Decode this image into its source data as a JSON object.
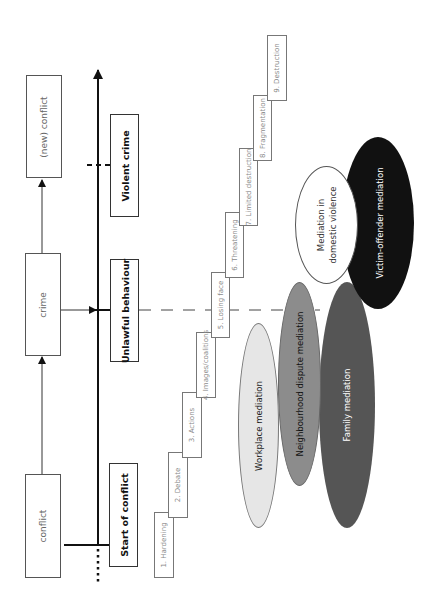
{
  "flow": {
    "nodes": [
      {
        "id": "conflict",
        "label": "conflict"
      },
      {
        "id": "crime",
        "label": "crime"
      },
      {
        "id": "new_conflict",
        "label": "(new) conflict"
      }
    ]
  },
  "stages": [
    {
      "id": "start",
      "label": "Start of conflict"
    },
    {
      "id": "unlawful",
      "label": "Unlawful behaviour"
    },
    {
      "id": "violent",
      "label": "Violent crime"
    }
  ],
  "escalation_steps": [
    {
      "n": 1,
      "label": "1. Hardening"
    },
    {
      "n": 2,
      "label": "2. Debate"
    },
    {
      "n": 3,
      "label": "3. Actions"
    },
    {
      "n": 4,
      "label": "4. Images/coalitions"
    },
    {
      "n": 5,
      "label": "5. Losing face"
    },
    {
      "n": 6,
      "label": "6. Threatening"
    },
    {
      "n": 7,
      "label": "7. Limited destruction"
    },
    {
      "n": 8,
      "label": "8. Fragmentation"
    },
    {
      "n": 9,
      "label": "9. Destruction"
    }
  ],
  "mediation_types": [
    {
      "id": "workplace",
      "label": "Workplace mediation",
      "fill": "#e6e6e6",
      "text_color": "#222222"
    },
    {
      "id": "neighbourhood",
      "label": "Neighbourhood dispute mediation",
      "fill": "#8c8c8c",
      "text_color": "#111111"
    },
    {
      "id": "family",
      "label": "Family mediation",
      "fill": "#555555",
      "text_color": "#ffffff"
    },
    {
      "id": "victim_offender",
      "label": "Victim-offender mediation",
      "fill": "#111111",
      "text_color": "#ffffff"
    },
    {
      "id": "domestic",
      "label_line1": "Mediation in",
      "label_line2": "domestic violence",
      "fill": "#ffffff",
      "text_color": "#333333"
    }
  ]
}
